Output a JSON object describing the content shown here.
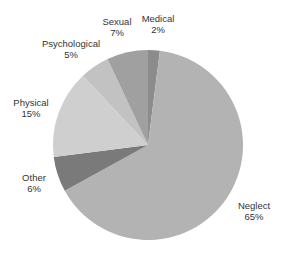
{
  "chart_data": {
    "type": "pie",
    "title": "",
    "categories": [
      "Medical",
      "Neglect",
      "Other",
      "Physical",
      "Psychological",
      "Sexual"
    ],
    "values": [
      2,
      65,
      6,
      15,
      5,
      7
    ],
    "labels": [
      {
        "name": "Medical",
        "pct": "2%"
      },
      {
        "name": "Neglect",
        "pct": "65%"
      },
      {
        "name": "Other",
        "pct": "6%"
      },
      {
        "name": "Physical",
        "pct": "15%"
      },
      {
        "name": "Psychological",
        "pct": "5%"
      },
      {
        "name": "Sexual",
        "pct": "7%"
      }
    ],
    "colors": [
      "#8c8c8c",
      "#b3b3b3",
      "#7a7a7a",
      "#cfcfcf",
      "#c2c2c2",
      "#a0a0a0"
    ],
    "start_angle_deg": 0,
    "direction": "clockwise",
    "legend": "none (inline labels)"
  }
}
